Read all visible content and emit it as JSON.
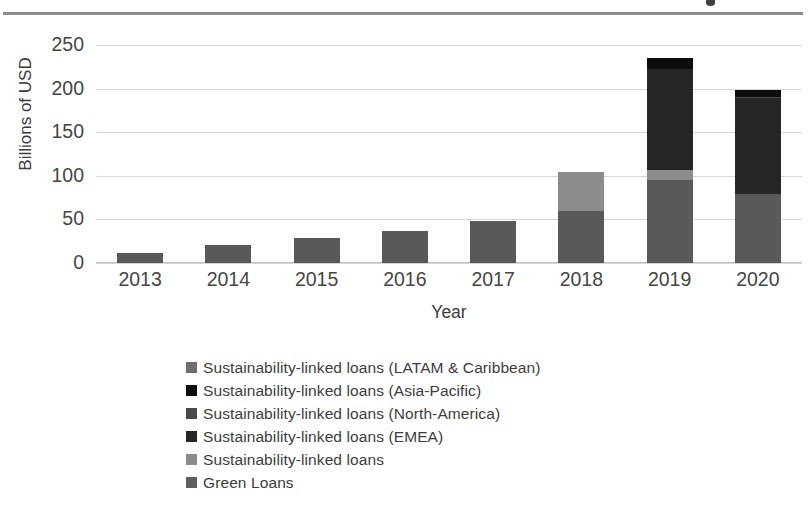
{
  "chart_data": {
    "type": "bar",
    "subtype": "stacked-bar",
    "title": "",
    "xlabel": "Year",
    "ylabel": "Billions of USD",
    "categories": [
      "2013",
      "2014",
      "2015",
      "2016",
      "2017",
      "2018",
      "2019",
      "2020"
    ],
    "yticks": [
      "250",
      "200",
      "150",
      "100",
      "50",
      "0"
    ],
    "ylim": [
      0,
      250
    ],
    "grid": true,
    "legend_position": "bottom",
    "series": [
      {
        "name": "Green Loans",
        "color": "#595959",
        "values": [
          11,
          21,
          29,
          37,
          48,
          60,
          95,
          79
        ]
      },
      {
        "name": "Sustainability-linked loans",
        "color": "#8c8c8c",
        "values": [
          0,
          0,
          0,
          0,
          0,
          44,
          12,
          0
        ]
      },
      {
        "name": "Sustainability-linked loans (EMEA)",
        "color": "#262626",
        "values": [
          0,
          0,
          0,
          0,
          0,
          0,
          116,
          110
        ]
      },
      {
        "name": "Sustainability-linked loans (North-America)",
        "color": "#4a4a4a",
        "values": [
          0,
          0,
          0,
          0,
          0,
          0,
          0,
          1
        ]
      },
      {
        "name": "Sustainability-linked loans (Asia-Pacific)",
        "color": "#0d0d0d",
        "values": [
          0,
          0,
          0,
          0,
          0,
          0,
          12,
          8
        ]
      },
      {
        "name": "Sustainability-linked loans (LATAM & Caribbean)",
        "color": "#6e6e6e",
        "values": [
          0,
          0,
          0,
          0,
          0,
          0,
          0,
          0
        ]
      }
    ],
    "totals": [
      11,
      21,
      29,
      37,
      48,
      104,
      235,
      198
    ]
  },
  "axis": {
    "ylabel": "Billions of USD",
    "xlabel": "Year",
    "yticks": [
      {
        "label": "250",
        "value": 250
      },
      {
        "label": "200",
        "value": 200
      },
      {
        "label": "150",
        "value": 150
      },
      {
        "label": "100",
        "value": 100
      },
      {
        "label": "50",
        "value": 50
      },
      {
        "label": "0",
        "value": 0
      }
    ],
    "xticks": [
      "2013",
      "2014",
      "2015",
      "2016",
      "2017",
      "2018",
      "2019",
      "2020"
    ]
  },
  "legend": {
    "items": [
      {
        "label": "Sustainability-linked loans (LATAM & Caribbean)",
        "color": "#6e6e6e"
      },
      {
        "label": "Sustainability-linked loans (Asia-Pacific)",
        "color": "#0d0d0d"
      },
      {
        "label": "Sustainability-linked loans (North-America)",
        "color": "#4a4a4a"
      },
      {
        "label": "Sustainability-linked loans (EMEA)",
        "color": "#262626"
      },
      {
        "label": "Sustainability-linked loans",
        "color": "#8c8c8c"
      },
      {
        "label": "Green Loans",
        "color": "#5f5f5f"
      }
    ]
  },
  "colors": {
    "background": "#ffffff",
    "gridline": "#d6d6d6",
    "text": "#3b3b3b",
    "top_rule": "#8d8d8d"
  }
}
